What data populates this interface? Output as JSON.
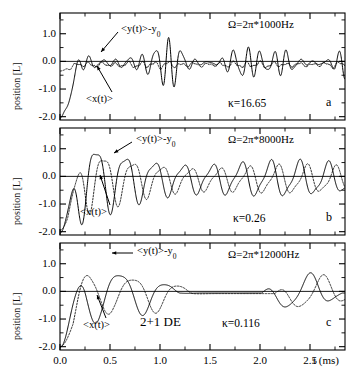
{
  "figure": {
    "axis_y_label": "position [L]",
    "axis_x_label": "t (ms)",
    "y_ticks": [
      "1.0",
      "0.0",
      "-1.0",
      "-2.0"
    ],
    "x_ticks": [
      "0.0",
      "0.5",
      "1.0",
      "1.5",
      "2.0",
      "2.5"
    ],
    "series_label_y": "<y(t)>-y",
    "series_label_y_sub": "0",
    "series_label_x": "<x(t)>",
    "model_tag": "2+1 DE"
  },
  "panels": [
    {
      "letter": "a",
      "omega": "Ω=2π*1000Hz",
      "kappa": "κ=16.65"
    },
    {
      "letter": "b",
      "omega": "Ω=2π*8000Hz",
      "kappa": "κ=0.26"
    },
    {
      "letter": "c",
      "omega": "Ω=2π*12000Hz",
      "kappa": "κ=0.116"
    }
  ],
  "chart_data": {
    "type": "line",
    "title": "",
    "xlabel": "t (ms)",
    "ylabel": "position [L]",
    "xlim": [
      0.0,
      2.85
    ],
    "ylim": [
      -2.12,
      1.75
    ],
    "grid": false,
    "legend": "in-plot arrow annotations",
    "x_ticks": [
      0.0,
      0.5,
      1.0,
      1.5,
      2.0,
      2.5
    ],
    "y_ticks": [
      1.0,
      0.0,
      -1.0,
      -2.0
    ],
    "panels": [
      {
        "letter": "a",
        "omega_hz": 1000,
        "omega_text": "Ω=2π*1000Hz",
        "kappa": 16.65,
        "series": [
          {
            "name": "<y(t)>-y0",
            "style": "solid",
            "start_value": -2.05,
            "model": {
              "kind": "beating-oscillation",
              "carrier_freq_khz": 7.6,
              "modulation_freq_khz": 1.0,
              "envelope_amplitude": 1.25,
              "damping_per_ms": 0.05,
              "offset": -0.05,
              "rise_time_ms": 0.22
            }
          },
          {
            "name": "<x(t)>",
            "style": "dotted",
            "start_value": -0.35,
            "model": {
              "kind": "small-amplitude-ripple",
              "carrier_freq_khz": 7.6,
              "modulation_freq_khz": 1.0,
              "envelope_amplitude": 0.17,
              "damping_per_ms": 0.12,
              "offset": -0.12,
              "rise_time_ms": 0.18
            }
          }
        ]
      },
      {
        "letter": "b",
        "omega_hz": 8000,
        "omega_text": "Ω=2π*8000Hz",
        "kappa": 0.26,
        "series": [
          {
            "name": "<y(t)>-y0",
            "style": "solid",
            "start_value": -2.05,
            "model": {
              "kind": "damped-oscillation",
              "carrier_freq_khz": 3.45,
              "envelope_amplitude": 1.52,
              "damping_per_ms": 0.33,
              "floor_amplitude": 0.52,
              "offset": -0.09,
              "rise_time_ms": 0.23
            }
          },
          {
            "name": "<x(t)>",
            "style": "dotted",
            "start_value": -1.95,
            "phase_lag_ms": 0.075,
            "model": {
              "kind": "damped-oscillation",
              "carrier_freq_khz": 3.45,
              "envelope_amplitude": 1.15,
              "damping_per_ms": 0.33,
              "floor_amplitude": 0.42,
              "offset": -0.11,
              "rise_time_ms": 0.26
            }
          }
        ]
      },
      {
        "letter": "c",
        "omega_hz": 12000,
        "omega_text": "Ω=2π*12000Hz",
        "kappa": 0.116,
        "series": [
          {
            "name": "<y(t)>-y0",
            "style": "solid",
            "start_value": -2.02,
            "model": {
              "kind": "collapse-revival",
              "carrier_freq_khz": 2.1,
              "revival_freq_khz": 0.62,
              "initial_amplitude": 1.62,
              "collapse_time_ms": 1.3,
              "revival_amplitude": 0.75,
              "offset": -0.06,
              "rise_time_ms": 0.26
            }
          },
          {
            "name": "<x(t)>",
            "style": "dotted",
            "start_value": -2.0,
            "phase_lag_ms": 0.13,
            "model": {
              "kind": "collapse-revival",
              "carrier_freq_khz": 2.1,
              "revival_freq_khz": 0.62,
              "initial_amplitude": 1.1,
              "collapse_time_ms": 1.3,
              "revival_amplitude": 0.7,
              "offset": -0.08,
              "rise_time_ms": 0.3
            }
          }
        ]
      }
    ]
  }
}
